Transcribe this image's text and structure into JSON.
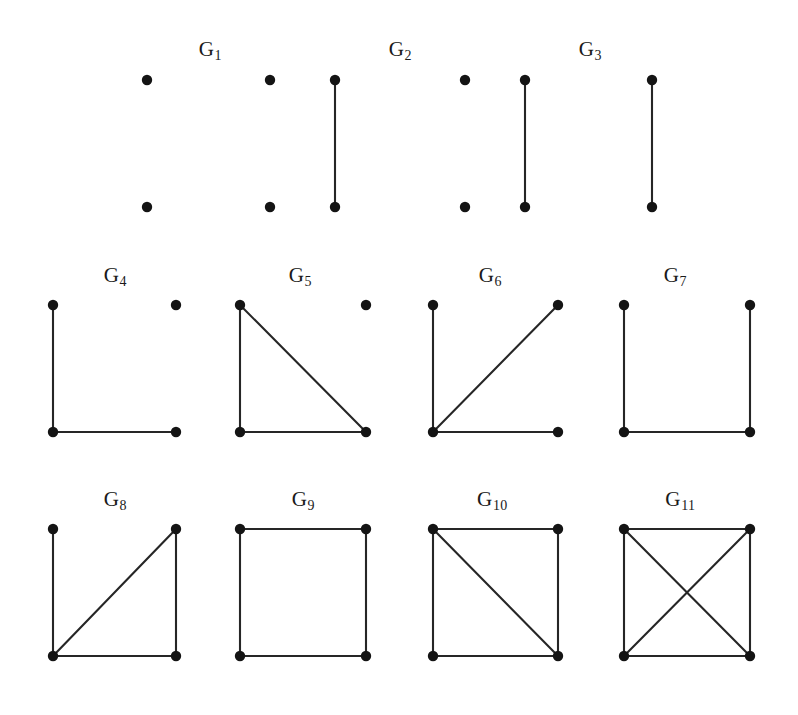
{
  "figure": {
    "background_color": "#ffffff",
    "vertex_color": "#141414",
    "edge_color": "#262626",
    "vertex_radius": 5.2,
    "edge_width": 2.1,
    "width": 798,
    "height": 715
  },
  "labels": {
    "g1": "G",
    "g1_sub": "1",
    "g2": "G",
    "g2_sub": "2",
    "g3": "G",
    "g3_sub": "3",
    "g4": "G",
    "g4_sub": "4",
    "g5": "G",
    "g5_sub": "5",
    "g6": "G",
    "g6_sub": "6",
    "g7": "G",
    "g7_sub": "7",
    "g8": "G",
    "g8_sub": "8",
    "g9": "G",
    "g9_sub": "9",
    "g10": "G",
    "g10_sub": "10",
    "g11": "G",
    "g11_sub": "11"
  },
  "chart_data": {
    "type": "diagram",
    "subtype": "graph-gallery",
    "vertex_keys": [
      "TL",
      "TR",
      "BL",
      "BR"
    ],
    "rows": [
      {
        "row": 1,
        "label_y": 52,
        "top_y": 80,
        "bottom_y": 207,
        "items": [
          {
            "id": "G1",
            "label": "G1",
            "label_x": 210,
            "label_y": 52,
            "edge_count": 0,
            "vertices": [
              {
                "key": "a",
                "x": 147,
                "y": 80
              },
              {
                "key": "b",
                "x": 147,
                "y": 207
              }
            ],
            "edges": []
          },
          {
            "id": "G1b",
            "label": "",
            "edge_count": 0,
            "vertices": [
              {
                "key": "a",
                "x": 270,
                "y": 80
              },
              {
                "key": "b",
                "x": 270,
                "y": 207
              }
            ],
            "edges": []
          },
          {
            "id": "G2a",
            "label": "G2",
            "label_x": 400,
            "label_y": 52,
            "edge_count": 1,
            "vertices": [
              {
                "key": "a",
                "x": 335,
                "y": 80
              },
              {
                "key": "b",
                "x": 335,
                "y": 207
              }
            ],
            "edges": [
              [
                "a",
                "b"
              ]
            ]
          },
          {
            "id": "G2b",
            "label": "",
            "edge_count": 0,
            "vertices": [
              {
                "key": "a",
                "x": 465,
                "y": 80
              },
              {
                "key": "b",
                "x": 465,
                "y": 207
              }
            ],
            "edges": []
          },
          {
            "id": "G3a",
            "label": "G3",
            "label_x": 590,
            "label_y": 52,
            "edge_count": 1,
            "vertices": [
              {
                "key": "a",
                "x": 525,
                "y": 80
              },
              {
                "key": "b",
                "x": 525,
                "y": 207
              }
            ],
            "edges": [
              [
                "a",
                "b"
              ]
            ]
          },
          {
            "id": "G3b",
            "label": "",
            "edge_count": 1,
            "vertices": [
              {
                "key": "a",
                "x": 652,
                "y": 80
              },
              {
                "key": "b",
                "x": 652,
                "y": 207
              }
            ],
            "edges": [
              [
                "a",
                "b"
              ]
            ]
          }
        ]
      },
      {
        "row": 2,
        "label_y": 278,
        "top_y": 305,
        "bottom_y": 432,
        "items": [
          {
            "id": "G4",
            "label": "G4",
            "label_x": 115,
            "label_y": 278,
            "edge_count": 2,
            "vertices": [
              {
                "key": "TL",
                "x": 53,
                "y": 305
              },
              {
                "key": "TR",
                "x": 176,
                "y": 305
              },
              {
                "key": "BL",
                "x": 53,
                "y": 432
              },
              {
                "key": "BR",
                "x": 176,
                "y": 432
              }
            ],
            "edges": [
              [
                "TL",
                "BL"
              ],
              [
                "BL",
                "BR"
              ]
            ]
          },
          {
            "id": "G5",
            "label": "G5",
            "label_x": 300,
            "label_y": 278,
            "edge_count": 3,
            "vertices": [
              {
                "key": "TL",
                "x": 240,
                "y": 305
              },
              {
                "key": "TR",
                "x": 366,
                "y": 305
              },
              {
                "key": "BL",
                "x": 240,
                "y": 432
              },
              {
                "key": "BR",
                "x": 366,
                "y": 432
              }
            ],
            "edges": [
              [
                "TL",
                "BL"
              ],
              [
                "BL",
                "BR"
              ],
              [
                "TL",
                "BR"
              ]
            ]
          },
          {
            "id": "G6",
            "label": "G6",
            "label_x": 490,
            "label_y": 278,
            "edge_count": 3,
            "vertices": [
              {
                "key": "TL",
                "x": 433,
                "y": 305
              },
              {
                "key": "TR",
                "x": 558,
                "y": 305
              },
              {
                "key": "BL",
                "x": 433,
                "y": 432
              },
              {
                "key": "BR",
                "x": 558,
                "y": 432
              }
            ],
            "edges": [
              [
                "TL",
                "BL"
              ],
              [
                "BL",
                "BR"
              ],
              [
                "BL",
                "TR"
              ]
            ]
          },
          {
            "id": "G7",
            "label": "G7",
            "label_x": 675,
            "label_y": 278,
            "edge_count": 3,
            "vertices": [
              {
                "key": "TL",
                "x": 624,
                "y": 305
              },
              {
                "key": "TR",
                "x": 750,
                "y": 305
              },
              {
                "key": "BL",
                "x": 624,
                "y": 432
              },
              {
                "key": "BR",
                "x": 750,
                "y": 432
              }
            ],
            "edges": [
              [
                "TL",
                "BL"
              ],
              [
                "BL",
                "BR"
              ],
              [
                "BR",
                "TR"
              ]
            ]
          }
        ]
      },
      {
        "row": 3,
        "label_y": 502,
        "top_y": 529,
        "bottom_y": 656,
        "items": [
          {
            "id": "G8",
            "label": "G8",
            "label_x": 115,
            "label_y": 502,
            "edge_count": 4,
            "vertices": [
              {
                "key": "TL",
                "x": 53,
                "y": 529
              },
              {
                "key": "TR",
                "x": 176,
                "y": 529
              },
              {
                "key": "BL",
                "x": 53,
                "y": 656
              },
              {
                "key": "BR",
                "x": 176,
                "y": 656
              }
            ],
            "edges": [
              [
                "TL",
                "BL"
              ],
              [
                "BL",
                "BR"
              ],
              [
                "BR",
                "TR"
              ],
              [
                "BL",
                "TR"
              ]
            ]
          },
          {
            "id": "G9",
            "label": "G9",
            "label_x": 303,
            "label_y": 502,
            "edge_count": 4,
            "vertices": [
              {
                "key": "TL",
                "x": 240,
                "y": 529
              },
              {
                "key": "TR",
                "x": 366,
                "y": 529
              },
              {
                "key": "BL",
                "x": 240,
                "y": 656
              },
              {
                "key": "BR",
                "x": 366,
                "y": 656
              }
            ],
            "edges": [
              [
                "TL",
                "TR"
              ],
              [
                "TL",
                "BL"
              ],
              [
                "BL",
                "BR"
              ],
              [
                "BR",
                "TR"
              ]
            ]
          },
          {
            "id": "G10",
            "label": "G10",
            "label_x": 492,
            "label_y": 502,
            "edge_count": 5,
            "vertices": [
              {
                "key": "TL",
                "x": 433,
                "y": 529
              },
              {
                "key": "TR",
                "x": 558,
                "y": 529
              },
              {
                "key": "BL",
                "x": 433,
                "y": 656
              },
              {
                "key": "BR",
                "x": 558,
                "y": 656
              }
            ],
            "edges": [
              [
                "TL",
                "TR"
              ],
              [
                "TL",
                "BL"
              ],
              [
                "BL",
                "BR"
              ],
              [
                "BR",
                "TR"
              ],
              [
                "TL",
                "BR"
              ]
            ]
          },
          {
            "id": "G11",
            "label": "G11",
            "label_x": 680,
            "label_y": 502,
            "edge_count": 6,
            "vertices": [
              {
                "key": "TL",
                "x": 624,
                "y": 529
              },
              {
                "key": "TR",
                "x": 750,
                "y": 529
              },
              {
                "key": "BL",
                "x": 624,
                "y": 656
              },
              {
                "key": "BR",
                "x": 750,
                "y": 656
              }
            ],
            "edges": [
              [
                "TL",
                "TR"
              ],
              [
                "TL",
                "BL"
              ],
              [
                "BL",
                "BR"
              ],
              [
                "BR",
                "TR"
              ],
              [
                "TL",
                "BR"
              ],
              [
                "BL",
                "TR"
              ]
            ]
          }
        ]
      }
    ]
  }
}
